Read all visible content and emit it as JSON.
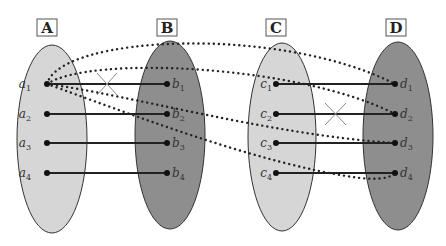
{
  "diagram": {
    "sets": [
      {
        "name": "A",
        "fill": "#d6d6d6",
        "elements": [
          {
            "base": "a",
            "sub": "1"
          },
          {
            "base": "a",
            "sub": "2"
          },
          {
            "base": "a",
            "sub": "3"
          },
          {
            "base": "a",
            "sub": "4"
          }
        ]
      },
      {
        "name": "B",
        "fill": "#8e8e8e",
        "elements": [
          {
            "base": "b",
            "sub": "1"
          },
          {
            "base": "b",
            "sub": "2"
          },
          {
            "base": "b",
            "sub": "3"
          },
          {
            "base": "b",
            "sub": "4"
          }
        ]
      },
      {
        "name": "C",
        "fill": "#d6d6d6",
        "elements": [
          {
            "base": "c",
            "sub": "1"
          },
          {
            "base": "c",
            "sub": "2"
          },
          {
            "base": "c",
            "sub": "3"
          },
          {
            "base": "c",
            "sub": "4"
          }
        ]
      },
      {
        "name": "D",
        "fill": "#8e8e8e",
        "elements": [
          {
            "base": "d",
            "sub": "1"
          },
          {
            "base": "d",
            "sub": "2"
          },
          {
            "base": "d",
            "sub": "3"
          },
          {
            "base": "d",
            "sub": "4"
          }
        ]
      }
    ],
    "solid_mappings": [
      [
        "a1",
        "b1"
      ],
      [
        "a2",
        "b2"
      ],
      [
        "a3",
        "b3"
      ],
      [
        "a4",
        "b4"
      ],
      [
        "c1",
        "d1"
      ],
      [
        "c2",
        "d2"
      ],
      [
        "c3",
        "d3"
      ],
      [
        "c4",
        "d4"
      ]
    ],
    "dotted_mappings": [
      [
        "a1",
        "d1"
      ],
      [
        "a1",
        "d2"
      ],
      [
        "a1",
        "d3"
      ],
      [
        "a1",
        "d4"
      ]
    ],
    "crossed_marks": [
      {
        "between": "A-B",
        "near_row": "1"
      },
      {
        "between": "C-D",
        "near_row": "2"
      }
    ]
  }
}
